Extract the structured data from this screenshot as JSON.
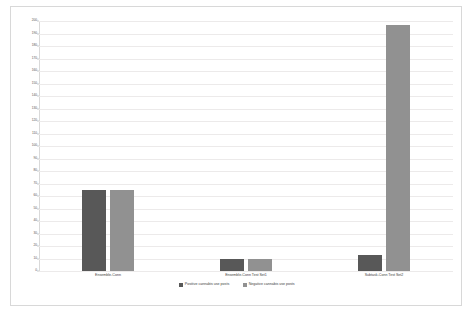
{
  "chart_data": {
    "type": "bar",
    "title": "",
    "xlabel": "",
    "ylabel": "Households",
    "categories": [
      "Ensemble-Conn",
      "Ensemble-Conn Test Set1",
      "Subtask-Conn Test Set2"
    ],
    "series": [
      {
        "name": "Positive cannabis use posts",
        "color": "#585858",
        "values": [
          65,
          10,
          13
        ]
      },
      {
        "name": "Negative cannabis use posts",
        "color": "#919191",
        "values": [
          65,
          10,
          197
        ]
      }
    ],
    "ylim": [
      0,
      200
    ],
    "ytick_step": 10,
    "yticks": [
      0,
      10,
      20,
      30,
      40,
      50,
      60,
      70,
      80,
      90,
      100,
      110,
      120,
      130,
      140,
      150,
      160,
      170,
      180,
      190,
      200
    ],
    "ytick_labels": [
      "0",
      "10",
      "20",
      "30",
      "40",
      "50",
      "60",
      "70",
      "80",
      "90",
      "100",
      "110",
      "120",
      "130",
      "140",
      "150",
      "160",
      "170",
      "180",
      "190",
      "200"
    ],
    "grid": true,
    "legend_position": "bottom"
  }
}
